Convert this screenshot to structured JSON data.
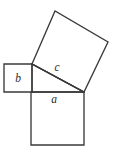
{
  "figure": {
    "name": "pythagorean-theorem-squares-diagram",
    "background_color": "#ffffff",
    "stroke_color": "#3a3a3c",
    "label_color": "#2b2b2d",
    "width": 118,
    "height": 159,
    "labels": {
      "leg_a": "a",
      "leg_b": "b",
      "hypotenuse_c": "c"
    },
    "shapes": {
      "square_a": {
        "label": "a",
        "points": "31,92 84,92 84,145 31,145",
        "side_length": 53
      },
      "square_b": {
        "label": "b",
        "points": "4,64 32,64 32,92 4,92",
        "side_length": 28
      },
      "square_c": {
        "label": "c",
        "points": "32,64 55,11 108,42 84,92",
        "side_length": 58
      },
      "triangle": {
        "points": "32,64 32,92 84,92"
      },
      "hypotenuse_segment": {
        "x1": 32,
        "y1": 64,
        "x2": 84,
        "y2": 92
      }
    },
    "label_positions": {
      "a": {
        "x": 54,
        "y": 103
      },
      "b": {
        "x": 18,
        "y": 82
      },
      "c": {
        "x": 57,
        "y": 71
      }
    }
  }
}
